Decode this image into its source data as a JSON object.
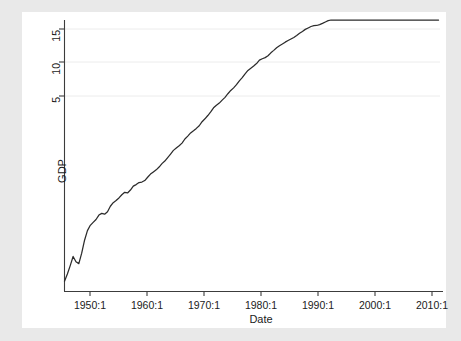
{
  "figure": {
    "background_color": "#e9e9e9",
    "plot_background_color": "#ffffff",
    "line_color": "#2b2b2b",
    "grid_color": "#eceaea",
    "axis_color": "#3c3c3c"
  },
  "chart_data": {
    "type": "line",
    "title": "",
    "subtitle": "",
    "xlabel": "Date",
    "ylabel": "GDP",
    "xlim": [
      1947.0,
      2012.5
    ],
    "ylim": [
      0,
      16.6
    ],
    "xticks": [
      "1950:1",
      "1960:1",
      "1970:1",
      "1980:1",
      "1990:1",
      "2000:1",
      "2010:1"
    ],
    "xtick_values": [
      1950,
      1960,
      1970,
      1980,
      1990,
      2000,
      2010
    ],
    "yticks": [
      "5",
      "10",
      "15"
    ],
    "ytick_values": [
      5,
      10,
      15
    ],
    "grid": "horizontal",
    "legend": "none",
    "series": [
      {
        "name": "GDP",
        "x": [
          1947.0,
          1947.5,
          1948.0,
          1948.5,
          1949.0,
          1949.5,
          1950.0,
          1950.5,
          1951.0,
          1951.5,
          1952.0,
          1952.5,
          1953.0,
          1953.5,
          1954.0,
          1954.5,
          1955.0,
          1955.5,
          1956.0,
          1956.5,
          1957.0,
          1957.5,
          1958.0,
          1958.5,
          1959.0,
          1959.5,
          1960.0,
          1960.5,
          1961.0,
          1961.5,
          1962.0,
          1962.5,
          1963.0,
          1963.5,
          1964.0,
          1964.5,
          1965.0,
          1965.5,
          1966.0,
          1966.5,
          1967.0,
          1967.5,
          1968.0,
          1968.5,
          1969.0,
          1969.5,
          1970.0,
          1970.5,
          1971.0,
          1971.5,
          1972.0,
          1972.5,
          1973.0,
          1973.5,
          1974.0,
          1974.5,
          1975.0,
          1975.5,
          1976.0,
          1976.5,
          1977.0,
          1977.5,
          1978.0,
          1978.5,
          1979.0,
          1979.5,
          1980.0,
          1980.5,
          1981.0,
          1981.5,
          1982.0,
          1982.5,
          1983.0,
          1983.5,
          1984.0,
          1984.5,
          1985.0,
          1985.5,
          1986.0,
          1986.5,
          1987.0,
          1987.5,
          1988.0,
          1988.5,
          1989.0,
          1989.5,
          1990.0,
          1990.5,
          1991.0,
          1991.5,
          1992.0,
          1992.5,
          1993.0,
          1993.5,
          1994.0,
          1994.5,
          1995.0,
          1995.5,
          1996.0,
          1996.5,
          1997.0,
          1997.5,
          1998.0,
          1998.5,
          1999.0,
          1999.5,
          2000.0,
          2000.5,
          2001.0,
          2001.5,
          2002.0,
          2002.5,
          2003.0,
          2003.5,
          2004.0,
          2004.5,
          2005.0,
          2005.5,
          2006.0,
          2006.5,
          2007.0,
          2007.5,
          2008.0,
          2008.5,
          2009.0,
          2009.5,
          2010.0,
          2010.5,
          2011.0,
          2011.5,
          2012.0,
          2012.25
        ],
        "values": [
          0.24,
          0.27,
          0.31,
          0.36,
          0.33,
          0.32,
          0.38,
          0.47,
          0.55,
          0.6,
          0.63,
          0.66,
          0.71,
          0.73,
          0.72,
          0.75,
          0.82,
          0.87,
          0.9,
          0.94,
          0.99,
          1.03,
          1.02,
          1.07,
          1.14,
          1.17,
          1.21,
          1.22,
          1.25,
          1.32,
          1.39,
          1.44,
          1.49,
          1.56,
          1.65,
          1.72,
          1.82,
          1.93,
          2.05,
          2.13,
          2.21,
          2.31,
          2.47,
          2.59,
          2.73,
          2.83,
          2.94,
          3.07,
          3.28,
          3.44,
          3.63,
          3.85,
          4.12,
          4.3,
          4.45,
          4.67,
          4.89,
          5.19,
          5.48,
          5.71,
          6.02,
          6.41,
          6.76,
          7.19,
          7.6,
          7.89,
          8.17,
          8.51,
          9.0,
          9.21,
          9.38,
          9.67,
          10.15,
          10.57,
          11.04,
          11.4,
          11.73,
          12.09,
          12.41,
          12.72,
          13.05,
          13.49,
          13.98,
          14.42,
          14.91,
          15.26,
          15.63,
          15.83,
          15.89,
          16.12,
          16.44,
          16.82,
          17.2,
          17.58,
          18.04,
          18.54,
          19.0,
          19.42,
          19.96,
          20.51,
          21.06,
          21.67,
          22.25,
          22.78,
          23.4,
          24.13,
          24.85,
          25.5,
          25.86,
          26.22,
          26.68,
          27.02,
          27.53,
          28.2,
          28.9,
          29.6,
          30.38,
          31.17,
          31.9,
          32.52,
          33.12,
          33.72,
          33.95,
          33.63,
          33.28,
          33.52,
          34.04,
          34.48,
          34.86,
          35.24,
          35.62,
          35.84
        ]
      }
    ]
  }
}
